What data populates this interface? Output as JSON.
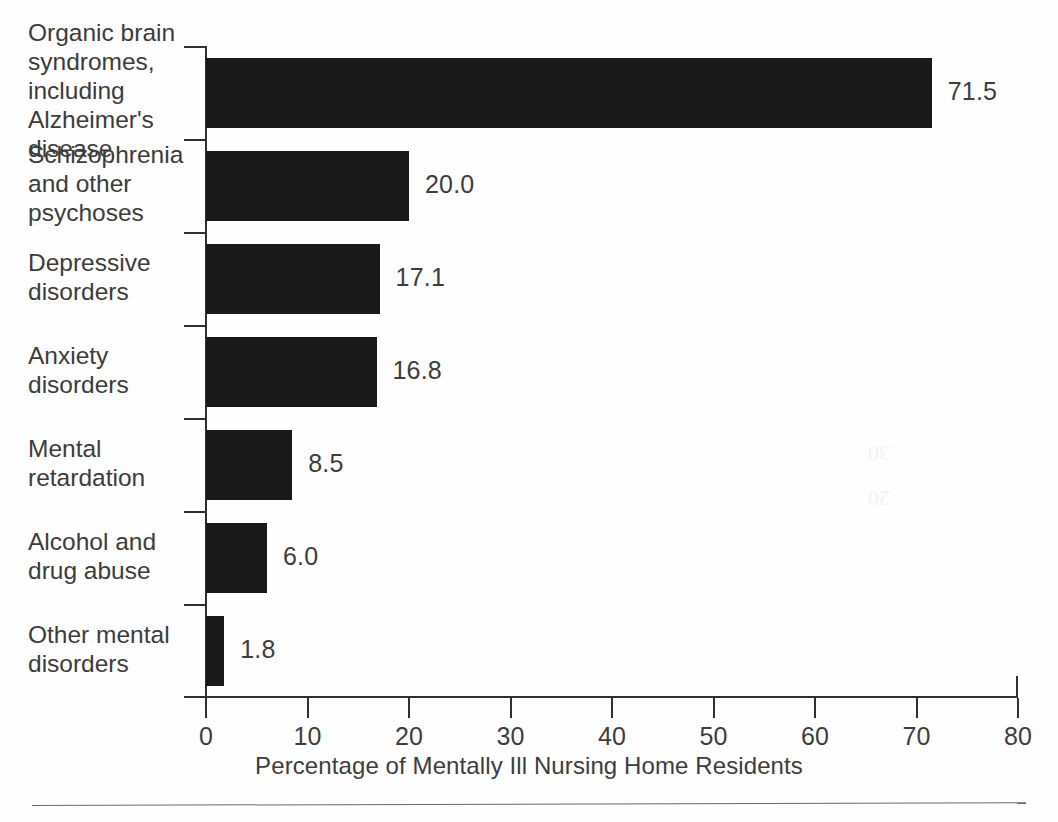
{
  "chart_data": {
    "type": "bar",
    "orientation": "horizontal",
    "title": "",
    "xlabel": "Percentage of Mentally Ill Nursing Home Residents",
    "ylabel": "",
    "xlim": [
      0,
      80
    ],
    "xticks": [
      "0",
      "10",
      "20",
      "30",
      "40",
      "50",
      "60",
      "70",
      "80"
    ],
    "grid": false,
    "legend": false,
    "categories": [
      "Organic brain\nsyndromes,\nincluding\nAlzheimer's\ndisease",
      "Schizophrenia\nand other\npsychoses",
      "Depressive\ndisorders",
      "Anxiety\ndisorders",
      "Mental\nretardation",
      "Alcohol and\ndrug abuse",
      "Other mental\ndisorders"
    ],
    "values": [
      71.5,
      20.0,
      17.1,
      16.8,
      8.5,
      6.0,
      1.8
    ],
    "value_labels": [
      "71.5",
      "20.0",
      "17.1",
      "16.8",
      "8.5",
      "6.0",
      "1.8"
    ],
    "bar_color": "#151515",
    "axis_color": "#2f2f2f",
    "text_color": "#3d3d3d",
    "background": "#ffffff"
  },
  "axis": {
    "title": "Percentage of Mentally Ill Nursing Home Residents"
  },
  "footer": {
    "caption": ""
  },
  "artifact": {
    "mark_top": "30",
    "mark_bottom": "20"
  }
}
